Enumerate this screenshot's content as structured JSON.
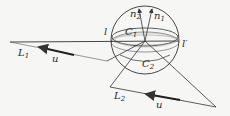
{
  "diagram": {
    "labels": {
      "n1": "n",
      "n1_sub": "1",
      "n2": "n",
      "n2_sub": "2",
      "l": "l",
      "l_prime": "l′",
      "C1": "C",
      "C1_sub": "1",
      "C2": "C",
      "C2_sub": "2",
      "L1": "L",
      "L1_sub": "1",
      "L2": "L",
      "L2_sub": "2",
      "u_top": "u",
      "u_bottom": "u"
    },
    "colors": {
      "stroke": "#333333",
      "background": "#f6f6f4"
    }
  }
}
